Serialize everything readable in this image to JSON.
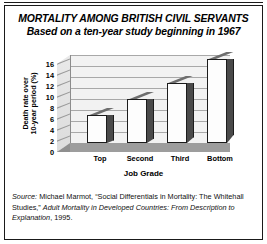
{
  "title": {
    "line1": "MORTALITY AMONG BRITISH CIVIL SERVANTS",
    "line2": "Based on a ten-year study beginning in 1967"
  },
  "source": {
    "prefix": "Source:",
    "author": " Michael Marmot, “Social Differentials in Mortality: The Whitehall Studies,” ",
    "work": "Adult Mortality in Developed Countries: From Description to Explanation",
    "suffix": ", 1995."
  },
  "chart_data": {
    "type": "bar",
    "title": "MORTALITY AMONG BRITISH CIVIL SERVANTS",
    "subtitle": "Based on a ten-year study beginning in 1967",
    "categories": [
      "Top",
      "Second",
      "Third",
      "Bottom"
    ],
    "values": [
      5.1,
      8.0,
      11.0,
      15.3
    ],
    "xlabel": "Job Grade",
    "ylabel": "Death rate over 10-year period (%)",
    "ylabel_line1": "Death rate over",
    "ylabel_line2": "10-year period (%)",
    "ylim": [
      0,
      16
    ],
    "ytick_step": 2,
    "yticks": [
      16,
      14,
      12,
      10,
      8,
      6,
      4,
      2,
      0
    ],
    "grid": true,
    "legend": "none",
    "style": "3d-column",
    "colors": {
      "bar_face": "#fdfdfd",
      "bar_side": "#4a4a4a",
      "bar_outline": "#1c1c1c",
      "back_wall": "#f2f2f2",
      "floor": "#9d9d9d",
      "gridline": "#a8a8a8",
      "text": "#000000"
    }
  }
}
